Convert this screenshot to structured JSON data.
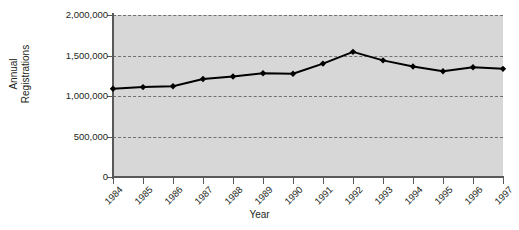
{
  "chart_data": {
    "type": "line",
    "title": "",
    "xlabel": "Year",
    "ylabel": "Annual Registrations",
    "ylabel_lines": [
      "Annual",
      "Registrations"
    ],
    "categories": [
      "1984",
      "1985",
      "1986",
      "1987",
      "1988",
      "1989",
      "1990",
      "1991",
      "1992",
      "1993",
      "1994",
      "1995",
      "1996",
      "1997"
    ],
    "values": [
      1090000,
      1110000,
      1120000,
      1210000,
      1240000,
      1280000,
      1275000,
      1400000,
      1545000,
      1440000,
      1365000,
      1305000,
      1355000,
      1335000
    ],
    "series": [
      {
        "name": "Annual Registrations",
        "values": [
          1090000,
          1110000,
          1120000,
          1210000,
          1240000,
          1280000,
          1275000,
          1400000,
          1545000,
          1440000,
          1365000,
          1305000,
          1355000,
          1335000
        ]
      }
    ],
    "ylim": [
      0,
      2000000
    ],
    "yticks": [
      0,
      500000,
      1000000,
      1500000,
      2000000
    ],
    "ytick_labels": [
      "0",
      "500,000",
      "1,000,000",
      "1,500,000",
      "2,000,000"
    ],
    "grid": "horizontal-dashed",
    "legend": "none",
    "marker": "diamond",
    "line_color": "#000000",
    "marker_color": "#000000",
    "plot_background": "#d7d7d7",
    "grid_color": "#707070",
    "axis_color": "#58595b",
    "text_color": "#231f20"
  }
}
